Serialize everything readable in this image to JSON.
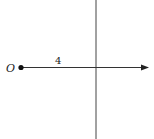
{
  "diagram": {
    "origin_label": "O",
    "segment_label": "4",
    "colors": {
      "line": "#333333",
      "background": "#ffffff"
    }
  }
}
